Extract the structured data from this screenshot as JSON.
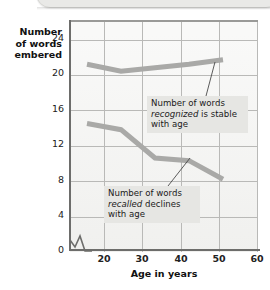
{
  "chart_data": {
    "type": "line",
    "title": "",
    "xlabel": "Age in years",
    "ylabel": "Number of words remembered",
    "ylabel_lines": [
      "Number",
      "of words",
      "embered"
    ],
    "xlim": [
      15,
      70
    ],
    "ylim": [
      0,
      26
    ],
    "xticks": [
      20,
      30,
      40,
      50,
      60,
      70
    ],
    "yticks": [
      0,
      4,
      8,
      12,
      16,
      20,
      24
    ],
    "grid": true,
    "legend": "none",
    "axis_break": "y-axis near zero",
    "x": [
      20,
      30,
      40,
      50,
      60
    ],
    "series": [
      {
        "name": "recognized",
        "values": [
          21.0,
          20.2,
          20.6,
          21.0,
          21.5
        ],
        "color": "#a9a9a7"
      },
      {
        "name": "recalled",
        "values": [
          14.3,
          13.6,
          10.4,
          10.1,
          8.0
        ],
        "color": "#a9a9a7"
      }
    ],
    "annotations": [
      {
        "id": "recognized",
        "line1": "Number of words",
        "emph": "recognized",
        "rest": " is stable",
        "line3": "with age"
      },
      {
        "id": "recalled",
        "line1": "Number of words",
        "emph": "recalled",
        "rest": " declines",
        "line3": "with age"
      }
    ]
  },
  "axis": {
    "y_labels": [
      "24",
      "20",
      "16",
      "12",
      "8",
      "4",
      "0"
    ],
    "x_labels": [
      "20",
      "30",
      "40",
      "50",
      "60",
      "70"
    ],
    "x_title": "Age in years",
    "y_title_line1": "Number",
    "y_title_line2": "of words",
    "y_title_line3": "embered"
  },
  "colors": {
    "line": "#a9a9a7",
    "grid": "#b9b9b7",
    "plot_bg": "#f4f4f2",
    "axis": "#6d6d6b",
    "annotation_bg": "#e6e6e3"
  }
}
